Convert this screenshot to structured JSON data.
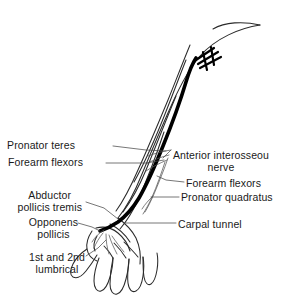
{
  "figure": {
    "background_color": "#ffffff",
    "ink_color": "#1a1a1a",
    "nerve_color": "#000000",
    "outline_color": "#2b2b2b",
    "width": 285,
    "height": 297
  },
  "labels": {
    "left": [
      {
        "id": "pronator-teres",
        "text": "Pronator teres"
      },
      {
        "id": "forearm-flexors-left",
        "text": "Forearm flexors"
      },
      {
        "id": "abductor-pollicis-brevis",
        "line1": "Abductor",
        "line2": "pollicis tremis"
      },
      {
        "id": "opponens-pollicis",
        "line1": "Opponens",
        "line2": "pollicis"
      },
      {
        "id": "lumbricals",
        "line1": "1st and 2nd",
        "line2": "lumbrical"
      }
    ],
    "right": [
      {
        "id": "anterior-interosseous",
        "line1": "Anterior interosseou",
        "line2": "nerve"
      },
      {
        "id": "forearm-flexors-right",
        "text": "Forearm flexors"
      },
      {
        "id": "pronator-quadratus",
        "text": "Pronator quadratus"
      },
      {
        "id": "carpal-tunnel",
        "text": "Carpal tunnel"
      }
    ]
  }
}
